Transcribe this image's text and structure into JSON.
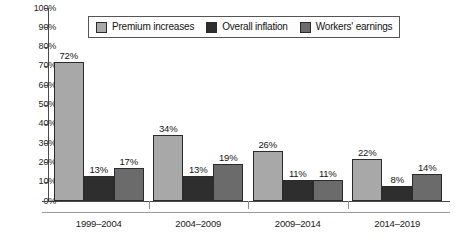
{
  "chart_data": {
    "type": "bar",
    "title": "",
    "xlabel": "",
    "ylabel": "",
    "ylim": [
      0,
      100
    ],
    "ytick_labels": [
      "100%",
      "90%",
      "80%",
      "70%",
      "60%",
      "50%",
      "40%",
      "30%",
      "20%",
      "10%",
      "0%"
    ],
    "ytick_values": [
      100,
      90,
      80,
      70,
      60,
      50,
      40,
      30,
      20,
      10,
      0
    ],
    "grid": false,
    "legend_position": "top-center",
    "categories": [
      "1999–2004",
      "2004–2009",
      "2009–2014",
      "2014–2019"
    ],
    "series": [
      {
        "name": "Premium increases",
        "color": "#a8a8a8",
        "values": [
          72,
          34,
          26,
          22
        ],
        "labels": [
          "72%",
          "34%",
          "26%",
          "22%"
        ]
      },
      {
        "name": "Overall inflation",
        "color": "#2e2e2e",
        "values": [
          13,
          13,
          11,
          8
        ],
        "labels": [
          "13%",
          "13%",
          "11%",
          "8%"
        ]
      },
      {
        "name": "Workers' earnings",
        "color": "#6b6b6b",
        "values": [
          17,
          19,
          11,
          14
        ],
        "labels": [
          "17%",
          "19%",
          "11%",
          "14%"
        ]
      }
    ]
  },
  "legend": {
    "items": [
      {
        "label": "Premium increases",
        "swatch": "#a8a8a8"
      },
      {
        "label": "Overall inflation",
        "swatch": "#2e2e2e"
      },
      {
        "label": "Workers' earnings",
        "swatch": "#6b6b6b"
      }
    ]
  }
}
